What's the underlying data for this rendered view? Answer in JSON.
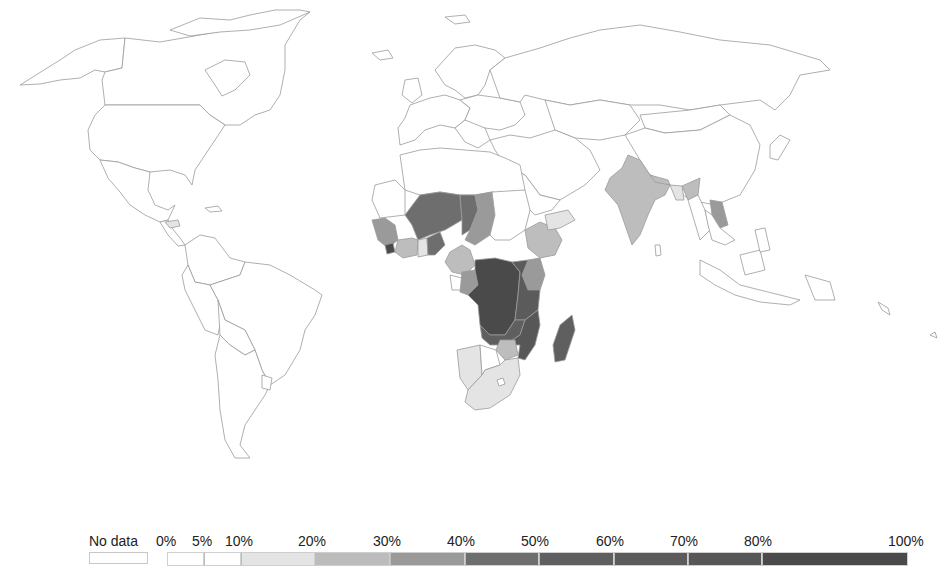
{
  "chart_data": {
    "type": "choropleth",
    "title": "",
    "legend": {
      "position": "bottom",
      "no_data_label": "No data",
      "no_data_color": "#ffffff",
      "breaks": [
        "0%",
        "5%",
        "10%",
        "20%",
        "30%",
        "40%",
        "50%",
        "60%",
        "70%",
        "80%",
        "100%"
      ],
      "bins": [
        {
          "range": "0%-5%",
          "color": "#ffffff"
        },
        {
          "range": "5%-10%",
          "color": "#ffffff"
        },
        {
          "range": "10%-20%",
          "color": "#e6e6e6"
        },
        {
          "range": "20%-30%",
          "color": "#bdbdbd"
        },
        {
          "range": "30%-40%",
          "color": "#9c9c9c"
        },
        {
          "range": "40%-50%",
          "color": "#6f6f6f"
        },
        {
          "range": "50%-60%",
          "color": "#5e5e5e"
        },
        {
          "range": "60%-70%",
          "color": "#5a5a5a"
        },
        {
          "range": "70%-80%",
          "color": "#565656"
        },
        {
          "range": "80%-100%",
          "color": "#4a4a4a"
        }
      ]
    },
    "shaded_regions": [
      {
        "region": "India",
        "bin": "20%-30%"
      },
      {
        "region": "Bangladesh",
        "bin": "10%-20%"
      },
      {
        "region": "Myanmar",
        "bin": "0%-5%"
      },
      {
        "region": "Laos",
        "bin": "30%-40%"
      },
      {
        "region": "Nepal/Bhutan area",
        "bin": "20%-30%"
      },
      {
        "region": "Mali",
        "bin": "40%-50%"
      },
      {
        "region": "Niger",
        "bin": "40%-50%"
      },
      {
        "region": "Burkina Faso",
        "bin": "40%-50%"
      },
      {
        "region": "Chad",
        "bin": "30%-40%"
      },
      {
        "region": "Senegal/Guinea",
        "bin": "30%-40%"
      },
      {
        "region": "Sierra Leone/Liberia",
        "bin": "80%-100%"
      },
      {
        "region": "Cote d'Ivoire",
        "bin": "20%-30%"
      },
      {
        "region": "Ghana",
        "bin": "10%-20%"
      },
      {
        "region": "Nigeria/Cameroon",
        "bin": "20%-30%"
      },
      {
        "region": "Central African Rep./DR Congo",
        "bin": "80%-100%"
      },
      {
        "region": "Congo",
        "bin": "30%-40%"
      },
      {
        "region": "Angola/Zambia",
        "bin": "60%-70%"
      },
      {
        "region": "Ethiopia",
        "bin": "20%-30%"
      },
      {
        "region": "Somalia",
        "bin": "10%-20%"
      },
      {
        "region": "Kenya",
        "bin": "30%-40%"
      },
      {
        "region": "Tanzania/Uganda",
        "bin": "60%-70%"
      },
      {
        "region": "Mozambique/Malawi",
        "bin": "70%-80%"
      },
      {
        "region": "Zimbabwe",
        "bin": "20%-30%"
      },
      {
        "region": "Madagascar",
        "bin": "60%-70%"
      },
      {
        "region": "Namibia",
        "bin": "10%-20%"
      },
      {
        "region": "South Africa",
        "bin": "10%-20%"
      },
      {
        "region": "Honduras",
        "bin": "10%-20%"
      }
    ]
  },
  "legend": {
    "no_data": "No data",
    "ticks": [
      {
        "label": "0%",
        "x": 156
      },
      {
        "label": "5%",
        "x": 192
      },
      {
        "label": "10%",
        "x": 225
      },
      {
        "label": "20%",
        "x": 298
      },
      {
        "label": "30%",
        "x": 373
      },
      {
        "label": "40%",
        "x": 447
      },
      {
        "label": "50%",
        "x": 521
      },
      {
        "label": "60%",
        "x": 596
      },
      {
        "label": "70%",
        "x": 670
      },
      {
        "label": "80%",
        "x": 744
      },
      {
        "label": "100%",
        "x": 888
      }
    ],
    "segments": [
      {
        "x": 167,
        "w": 37,
        "color": "#ffffff"
      },
      {
        "x": 204,
        "w": 37,
        "color": "#ffffff"
      },
      {
        "x": 241,
        "w": 74,
        "color": "#e4e4e4"
      },
      {
        "x": 315,
        "w": 75,
        "color": "#bcbcbc"
      },
      {
        "x": 390,
        "w": 75,
        "color": "#9a9a9a"
      },
      {
        "x": 465,
        "w": 74,
        "color": "#6e6e6e"
      },
      {
        "x": 539,
        "w": 75,
        "color": "#5f5f5f"
      },
      {
        "x": 614,
        "w": 74,
        "color": "#5b5b5b"
      },
      {
        "x": 688,
        "w": 74,
        "color": "#575757"
      },
      {
        "x": 762,
        "w": 146,
        "color": "#4a4a4a"
      }
    ]
  }
}
